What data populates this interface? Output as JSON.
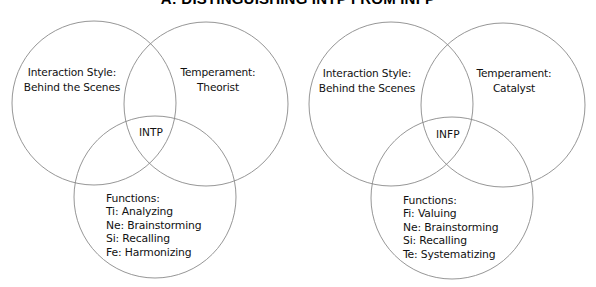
{
  "title": "A: DISTINGUISHING INTP FROM INFP",
  "colors": {
    "background": "#ffffff",
    "circle_stroke": "#8a8a8a",
    "text": "#111111"
  },
  "diagrams": [
    {
      "type": "INTP",
      "center_label": "INTP",
      "interaction_style": {
        "line1": "Interaction Style:",
        "line2": "Behind the Scenes"
      },
      "temperament": {
        "line1": "Temperament:",
        "line2": "Theorist"
      },
      "functions": {
        "heading": "Functions:",
        "items": [
          "Ti: Analyzing",
          "Ne: Brainstorming",
          "Si: Recalling",
          "Fe: Harmonizing"
        ]
      }
    },
    {
      "type": "INFP",
      "center_label": "INFP",
      "interaction_style": {
        "line1": "Interaction Style:",
        "line2": "Behind the Scenes"
      },
      "temperament": {
        "line1": "Temperament:",
        "line2": "Catalyst"
      },
      "functions": {
        "heading": "Functions:",
        "items": [
          "Fi: Valuing",
          "Ne: Brainstorming",
          "Si: Recalling",
          "Te: Systematizing"
        ]
      }
    }
  ]
}
